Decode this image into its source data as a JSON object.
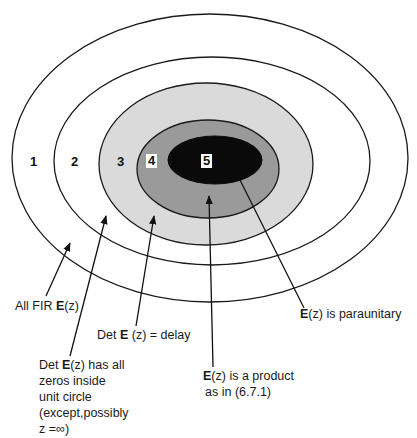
{
  "diagram": {
    "type": "nested-sets",
    "colors": {
      "ring1": "#ffffff",
      "ring2": "#ffffff",
      "ring3": "#dadada",
      "ring4": "#9a9a9a",
      "ring5": "#0a0a0a",
      "stroke": "#1a1a1a"
    },
    "regions": [
      {
        "number": "1",
        "label_bold": "",
        "label_pre": "All FIR ",
        "label_post_bold": "E",
        "label_post": "(z)"
      },
      {
        "number": "2",
        "lines": [
          "Det E(z) has all",
          "zeros inside",
          "unit circle",
          "(except,possibly",
          "z =∞)"
        ]
      },
      {
        "number": "3",
        "label": "Det E (z) = delay"
      },
      {
        "number": "4",
        "lines": [
          "E(z) is a product",
          "as in (6.7.1)"
        ]
      },
      {
        "number": "5",
        "label": "E(z) is paraunitary"
      }
    ],
    "numbers": [
      "1",
      "2",
      "3",
      "4",
      "5"
    ],
    "labels": {
      "l1_pre": "All FIR ",
      "l1_bold": "E",
      "l1_post": "(z)",
      "l2_pre": "Det ",
      "l2_bold": "E",
      "l2_post": "(z) has all",
      "l2_line2": "zeros inside",
      "l2_line3": "unit circle",
      "l2_line4": "(except,possibly",
      "l2_line5": "z =∞)",
      "l3_pre": "Det ",
      "l3_bold": "E",
      "l3_post": " (z) = delay",
      "l4_bold": "E",
      "l4_post": "(z) is a product",
      "l4_line2": "as in (6.7.1)",
      "l5_bold": "E",
      "l5_post": "(z) is paraunitary"
    }
  }
}
